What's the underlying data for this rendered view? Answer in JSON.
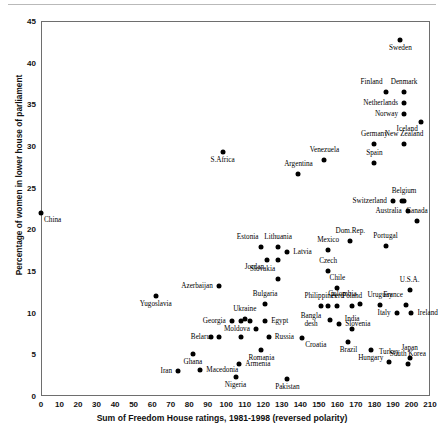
{
  "chart_data": {
    "type": "scatter",
    "title": "",
    "xlabel": "Sum of Freedom House ratings, 1981-1998 (reversed polarity)",
    "ylabel": "Percentage of women in lower house of parliament",
    "xlim": [
      0,
      210
    ],
    "ylim": [
      0,
      45
    ],
    "xticks": [
      0,
      10,
      20,
      30,
      40,
      50,
      60,
      70,
      80,
      90,
      100,
      110,
      120,
      130,
      140,
      150,
      160,
      170,
      180,
      190,
      200,
      210
    ],
    "yticks": [
      0,
      5,
      10,
      15,
      20,
      25,
      30,
      35,
      40,
      45
    ],
    "grid": false,
    "legend": null,
    "marker_color": "#000000",
    "points": [
      {
        "label": "China",
        "x": 0,
        "y": 22,
        "pos": "belowright"
      },
      {
        "label": "Sweden",
        "x": 194,
        "y": 42.7,
        "pos": "below"
      },
      {
        "label": "Finland",
        "x": 186,
        "y": 36.5,
        "pos": "aboveleft"
      },
      {
        "label": "Denmark",
        "x": 196,
        "y": 36.5,
        "pos": "above"
      },
      {
        "label": "Netherlands",
        "x": 196,
        "y": 35.2,
        "pos": "left"
      },
      {
        "label": "Norway",
        "x": 196,
        "y": 33.8,
        "pos": "left"
      },
      {
        "label": "Iceland",
        "x": 205,
        "y": 32.9,
        "pos": "belowleft"
      },
      {
        "label": "Germany",
        "x": 180,
        "y": 30.2,
        "pos": "above"
      },
      {
        "label": "New Zealand",
        "x": 196,
        "y": 30.2,
        "pos": "above"
      },
      {
        "label": "Venezuela",
        "x": 153,
        "y": 28.3,
        "pos": "above"
      },
      {
        "label": "Spain",
        "x": 180,
        "y": 28.0,
        "pos": "above"
      },
      {
        "label": "S.Africa",
        "x": 98,
        "y": 29.3,
        "pos": "below"
      },
      {
        "label": "Argentina",
        "x": 139,
        "y": 26.6,
        "pos": "above"
      },
      {
        "label": "Switzerland",
        "x": 190,
        "y": 23.4,
        "pos": "left"
      },
      {
        "label": "Belgium",
        "x": 196,
        "y": 23.4,
        "pos": "above"
      },
      {
        "label": "Australia",
        "x": 198,
        "y": 22.2,
        "pos": "left"
      },
      {
        "label": "Canada",
        "x": 203,
        "y": 21.0,
        "pos": "above"
      },
      {
        "label": "Portugal",
        "x": 186,
        "y": 18.0,
        "pos": "above"
      },
      {
        "label": "Estonia",
        "x": 119,
        "y": 17.9,
        "pos": "aboveleft"
      },
      {
        "label": "Lithuania",
        "x": 128,
        "y": 17.9,
        "pos": "above"
      },
      {
        "label": "Latvia",
        "x": 133,
        "y": 17.3,
        "pos": "right"
      },
      {
        "label": "Mexico",
        "x": 155,
        "y": 17.5,
        "pos": "above"
      },
      {
        "label": "Jordan",
        "x": 122,
        "y": 16.3,
        "pos": "belowleft"
      },
      {
        "label": "Czech",
        "x": 155,
        "y": 15.0,
        "pos": "above"
      },
      {
        "label": "Slovakia",
        "x": 128,
        "y": 14.0,
        "pos": "aboveleft"
      },
      {
        "label": "Azerbaijan",
        "x": 96,
        "y": 13.2,
        "pos": "left"
      },
      {
        "label": "Chile",
        "x": 160,
        "y": 13.0,
        "pos": "above"
      },
      {
        "label": "U.S.A.",
        "x": 199,
        "y": 12.7,
        "pos": "above"
      },
      {
        "label": "Yugoslavia",
        "x": 62,
        "y": 12.0,
        "pos": "below"
      },
      {
        "label": "Bulgaria",
        "x": 121,
        "y": 11.0,
        "pos": "above"
      },
      {
        "label": "Colombia",
        "x": 172,
        "y": 11.1,
        "pos": "aboveleft"
      },
      {
        "label": "Uruguay",
        "x": 183,
        "y": 10.9,
        "pos": "above"
      },
      {
        "label": "France",
        "x": 197,
        "y": 10.9,
        "pos": "aboveleft"
      },
      {
        "label": "Philippines",
        "x": 151,
        "y": 10.8,
        "pos": "above"
      },
      {
        "label": "Peru",
        "x": 160,
        "y": 10.8,
        "pos": "above"
      },
      {
        "label": "Poland",
        "x": 168,
        "y": 10.8,
        "pos": "above"
      },
      {
        "label": "Italy",
        "x": 192,
        "y": 10.0,
        "pos": "left"
      },
      {
        "label": "Ireland",
        "x": 200,
        "y": 10.0,
        "pos": "right"
      },
      {
        "label": "Ukraine",
        "x": 110,
        "y": 9.2,
        "pos": "above"
      },
      {
        "label": "Georgia",
        "x": 103,
        "y": 9.0,
        "pos": "left"
      },
      {
        "label": "Egypt",
        "x": 121,
        "y": 9.0,
        "pos": "right"
      },
      {
        "label": "Bangla desh",
        "x": 156,
        "y": 9.1,
        "pos": "left"
      },
      {
        "label": "Slovenia",
        "x": 161,
        "y": 8.6,
        "pos": "right"
      },
      {
        "label": "Moldova",
        "x": 116,
        "y": 8.0,
        "pos": "left"
      },
      {
        "label": "Belarus",
        "x": 96,
        "y": 7.1,
        "pos": "left"
      },
      {
        "label": "Russia",
        "x": 123,
        "y": 7.1,
        "pos": "right"
      },
      {
        "label": "Croatia",
        "x": 141,
        "y": 7.0,
        "pos": "belowright"
      },
      {
        "label": "Brazil",
        "x": 166,
        "y": 6.5,
        "pos": "below"
      },
      {
        "label": "Hungary",
        "x": 178,
        "y": 5.5,
        "pos": "below"
      },
      {
        "label": "Romania",
        "x": 119,
        "y": 5.5,
        "pos": "below"
      },
      {
        "label": "Ghana",
        "x": 82,
        "y": 5.0,
        "pos": "below"
      },
      {
        "label": "Turkey",
        "x": 188,
        "y": 4.1,
        "pos": "above"
      },
      {
        "label": "South Korea",
        "x": 198,
        "y": 3.9,
        "pos": "above"
      },
      {
        "label": "Japan",
        "x": 199,
        "y": 4.6,
        "pos": "above"
      },
      {
        "label": "Armenia",
        "x": 107,
        "y": 3.9,
        "pos": "right"
      },
      {
        "label": "Macedonia",
        "x": 86,
        "y": 3.1,
        "pos": "right"
      },
      {
        "label": "Iran",
        "x": 74,
        "y": 3.0,
        "pos": "left"
      },
      {
        "label": "Nigeria",
        "x": 105,
        "y": 2.3,
        "pos": "below"
      },
      {
        "label": "Pakistan",
        "x": 133,
        "y": 2.0,
        "pos": "below"
      },
      {
        "label": "Dom.Rep.",
        "x": 167,
        "y": 18.6,
        "pos": "above"
      },
      {
        "label": "India",
        "x": 168,
        "y": 8.1,
        "pos": "above"
      },
      {
        "label": "",
        "x": 128,
        "y": 16.3,
        "pos": "above"
      },
      {
        "label": "",
        "x": 108,
        "y": 9.0,
        "pos": "above"
      },
      {
        "label": "",
        "x": 113,
        "y": 9.0,
        "pos": "above"
      },
      {
        "label": "",
        "x": 92,
        "y": 7.1,
        "pos": "above"
      },
      {
        "label": "",
        "x": 108,
        "y": 7.1,
        "pos": "above"
      },
      {
        "label": "",
        "x": 155,
        "y": 10.8,
        "pos": "above"
      },
      {
        "label": "",
        "x": 195,
        "y": 23.4,
        "pos": "above"
      }
    ]
  }
}
